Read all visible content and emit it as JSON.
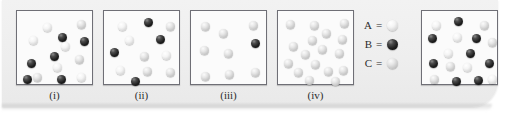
{
  "figure": {
    "type": "molecular-mixture-diagram",
    "background_color": "#eeeeee",
    "panel_background": "#fbfbfb",
    "panel_border_color": "#6f6f76"
  },
  "species": {
    "A": {
      "label": "A",
      "color": "#f0f0f0",
      "description": "pale-white sphere"
    },
    "B": {
      "label": "B",
      "color": "#101010",
      "description": "black sphere"
    },
    "C": {
      "label": "C",
      "color": "#d8d8d8",
      "description": "light-gray sphere"
    }
  },
  "legend": {
    "equals": "=",
    "rows": [
      {
        "key": "A",
        "species": "A"
      },
      {
        "key": "B",
        "species": "B"
      },
      {
        "key": "C",
        "species": "C"
      }
    ]
  },
  "panels": [
    {
      "id": "i",
      "label": "(i)",
      "counts": {
        "A": 6,
        "B": 7,
        "C": 3
      },
      "spheres": [
        {
          "t": "A",
          "x": 26,
          "y": 12
        },
        {
          "t": "C",
          "x": 60,
          "y": 9
        },
        {
          "t": "B",
          "x": 41,
          "y": 22
        },
        {
          "t": "A",
          "x": 12,
          "y": 25
        },
        {
          "t": "A",
          "x": 44,
          "y": 31
        },
        {
          "t": "B",
          "x": 63,
          "y": 26
        },
        {
          "t": "B",
          "x": 33,
          "y": 41
        },
        {
          "t": "C",
          "x": 58,
          "y": 44
        },
        {
          "t": "B",
          "x": 10,
          "y": 48
        },
        {
          "t": "A",
          "x": 36,
          "y": 52
        },
        {
          "t": "C",
          "x": 16,
          "y": 62
        },
        {
          "t": "B",
          "x": 6,
          "y": 64
        },
        {
          "t": "B",
          "x": 40,
          "y": 64
        },
        {
          "t": "A",
          "x": 60,
          "y": 62
        }
      ]
    },
    {
      "id": "ii",
      "label": "(ii)",
      "counts": {
        "A": 5,
        "B": 6,
        "C": 4
      },
      "spheres": [
        {
          "t": "A",
          "x": 14,
          "y": 11
        },
        {
          "t": "B",
          "x": 40,
          "y": 7
        },
        {
          "t": "C",
          "x": 62,
          "y": 11
        },
        {
          "t": "A",
          "x": 21,
          "y": 25
        },
        {
          "t": "B",
          "x": 52,
          "y": 24
        },
        {
          "t": "B",
          "x": 6,
          "y": 37
        },
        {
          "t": "C",
          "x": 36,
          "y": 41
        },
        {
          "t": "A",
          "x": 58,
          "y": 40
        },
        {
          "t": "A",
          "x": 12,
          "y": 55
        },
        {
          "t": "C",
          "x": 39,
          "y": 56
        },
        {
          "t": "C",
          "x": 62,
          "y": 57
        },
        {
          "t": "B",
          "x": 27,
          "y": 66
        }
      ]
    },
    {
      "id": "iii",
      "label": "(iii)",
      "counts": {
        "A": 0,
        "B": 1,
        "C": 8
      },
      "spheres": [
        {
          "t": "C",
          "x": 10,
          "y": 11
        },
        {
          "t": "C",
          "x": 28,
          "y": 18
        },
        {
          "t": "C",
          "x": 58,
          "y": 10
        },
        {
          "t": "B",
          "x": 60,
          "y": 28
        },
        {
          "t": "C",
          "x": 9,
          "y": 35
        },
        {
          "t": "C",
          "x": 33,
          "y": 38
        },
        {
          "t": "C",
          "x": 10,
          "y": 61
        },
        {
          "t": "C",
          "x": 34,
          "y": 59
        },
        {
          "t": "C",
          "x": 60,
          "y": 57
        }
      ]
    },
    {
      "id": "iv",
      "label": "(iv)",
      "counts": {
        "A": 0,
        "B": 0,
        "C": 17
      },
      "spheres": [
        {
          "t": "C",
          "x": 8,
          "y": 9
        },
        {
          "t": "C",
          "x": 32,
          "y": 10
        },
        {
          "t": "C",
          "x": 62,
          "y": 8
        },
        {
          "t": "C",
          "x": 44,
          "y": 18
        },
        {
          "t": "C",
          "x": 30,
          "y": 25
        },
        {
          "t": "C",
          "x": 60,
          "y": 24
        },
        {
          "t": "C",
          "x": 11,
          "y": 31
        },
        {
          "t": "C",
          "x": 40,
          "y": 34
        },
        {
          "t": "C",
          "x": 23,
          "y": 39
        },
        {
          "t": "C",
          "x": 57,
          "y": 38
        },
        {
          "t": "C",
          "x": 6,
          "y": 48
        },
        {
          "t": "C",
          "x": 33,
          "y": 49
        },
        {
          "t": "C",
          "x": 16,
          "y": 57
        },
        {
          "t": "C",
          "x": 46,
          "y": 56
        },
        {
          "t": "C",
          "x": 61,
          "y": 55
        },
        {
          "t": "C",
          "x": 27,
          "y": 65
        },
        {
          "t": "C",
          "x": 53,
          "y": 66
        }
      ]
    },
    {
      "id": "v",
      "label": "",
      "counts": {
        "A": 6,
        "B": 8,
        "C": 4
      },
      "spheres": [
        {
          "t": "A",
          "x": 10,
          "y": 10
        },
        {
          "t": "B",
          "x": 32,
          "y": 6
        },
        {
          "t": "C",
          "x": 58,
          "y": 10
        },
        {
          "t": "B",
          "x": 6,
          "y": 23
        },
        {
          "t": "A",
          "x": 31,
          "y": 22
        },
        {
          "t": "B",
          "x": 50,
          "y": 23
        },
        {
          "t": "C",
          "x": 66,
          "y": 27
        },
        {
          "t": "A",
          "x": 22,
          "y": 38
        },
        {
          "t": "B",
          "x": 44,
          "y": 38
        },
        {
          "t": "B",
          "x": 7,
          "y": 48
        },
        {
          "t": "C",
          "x": 24,
          "y": 51
        },
        {
          "t": "A",
          "x": 41,
          "y": 52
        },
        {
          "t": "B",
          "x": 63,
          "y": 48
        },
        {
          "t": "C",
          "x": 8,
          "y": 64
        },
        {
          "t": "B",
          "x": 30,
          "y": 66
        },
        {
          "t": "B",
          "x": 52,
          "y": 65
        },
        {
          "t": "A",
          "x": 66,
          "y": 64
        }
      ]
    }
  ],
  "panel_layout": [
    {
      "left": 16,
      "top": 10,
      "width": 77,
      "height": 75,
      "label_left": 16,
      "label_width": 77,
      "label_top": 89
    },
    {
      "left": 103,
      "top": 10,
      "width": 77,
      "height": 75,
      "label_left": 103,
      "label_width": 77,
      "label_top": 89
    },
    {
      "left": 190,
      "top": 10,
      "width": 77,
      "height": 75,
      "label_left": 190,
      "label_width": 77,
      "label_top": 89
    },
    {
      "left": 277,
      "top": 10,
      "width": 77,
      "height": 75,
      "label_left": 277,
      "label_width": 77,
      "label_top": 89
    },
    {
      "left": 421,
      "top": 10,
      "width": 77,
      "height": 75,
      "label_left": 421,
      "label_width": 77,
      "label_top": 89
    }
  ]
}
